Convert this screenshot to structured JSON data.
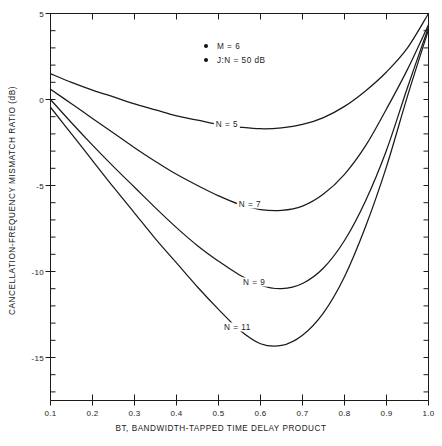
{
  "chart_data": {
    "type": "line",
    "title": "",
    "xlabel": "BT, BANDWIDTH-TAPPED TIME DELAY PRODUCT",
    "ylabel": "CANCELLATION-FREQUENCY MISMATCH RATIO (dB)",
    "xlim": [
      0.1,
      1.0
    ],
    "ylim": [
      -17.5,
      5
    ],
    "grid": false,
    "legend_position": "top-center",
    "xticks": [
      0.1,
      0.2,
      0.3,
      0.4,
      0.5,
      0.6,
      0.7,
      0.8,
      0.9,
      1.0
    ],
    "xtick_labels": [
      "0.1",
      "0.2",
      "0.3",
      "0.4",
      "0.5",
      "0.6",
      "0.7",
      "0.8",
      "0.9",
      "1.0"
    ],
    "yticks": [
      5,
      0,
      -5,
      -10,
      -15
    ],
    "ytick_labels": [
      "5",
      "0",
      "-5",
      "-10",
      "-15"
    ],
    "y_minor_ticks": [
      4,
      3,
      2,
      1,
      -1,
      -2,
      -3,
      -4,
      -6,
      -7,
      -8,
      -9,
      -11,
      -12,
      -13,
      -14,
      -16,
      -17
    ],
    "annotations": [
      {
        "text": "M = 6",
        "marker": "filled-circle"
      },
      {
        "text": "J:N = 50 dB",
        "marker": "filled-circle"
      }
    ],
    "series": [
      {
        "name": "N = 5",
        "label": "N = 5",
        "label_x": 0.52,
        "label_y": -1.45,
        "x": [
          0.1,
          0.15,
          0.2,
          0.25,
          0.3,
          0.35,
          0.4,
          0.45,
          0.5,
          0.55,
          0.6,
          0.65,
          0.7,
          0.75,
          0.8,
          0.85,
          0.9,
          0.95,
          1.0
        ],
        "y": [
          1.5,
          1.0,
          0.55,
          0.15,
          -0.25,
          -0.6,
          -0.95,
          -1.2,
          -1.45,
          -1.6,
          -1.7,
          -1.65,
          -1.45,
          -1.05,
          -0.4,
          0.5,
          1.6,
          3.0,
          5.0
        ]
      },
      {
        "name": "N = 7",
        "label": "N = 7",
        "label_x": 0.575,
        "label_y": -6.1,
        "x": [
          0.1,
          0.15,
          0.2,
          0.25,
          0.3,
          0.35,
          0.4,
          0.45,
          0.5,
          0.55,
          0.6,
          0.65,
          0.7,
          0.75,
          0.8,
          0.85,
          0.9,
          0.95,
          1.0
        ],
        "y": [
          0.6,
          -0.25,
          -1.1,
          -1.95,
          -2.8,
          -3.6,
          -4.35,
          -5.0,
          -5.6,
          -6.1,
          -6.4,
          -6.45,
          -6.2,
          -5.5,
          -4.35,
          -2.7,
          -0.55,
          1.75,
          4.35
        ]
      },
      {
        "name": "N = 9",
        "label": "N = 9",
        "label_x": 0.585,
        "label_y": -10.6,
        "x": [
          0.1,
          0.15,
          0.2,
          0.25,
          0.3,
          0.35,
          0.4,
          0.45,
          0.5,
          0.55,
          0.6,
          0.65,
          0.7,
          0.75,
          0.8,
          0.85,
          0.9,
          0.95,
          1.0
        ],
        "y": [
          0.0,
          -1.35,
          -2.65,
          -3.9,
          -5.1,
          -6.3,
          -7.45,
          -8.5,
          -9.4,
          -10.2,
          -10.8,
          -11.0,
          -10.7,
          -9.8,
          -8.2,
          -5.9,
          -2.95,
          0.7,
          4.2
        ]
      },
      {
        "name": "N = 11",
        "label": "N = 11",
        "label_x": 0.545,
        "label_y": -13.2,
        "x": [
          0.1,
          0.15,
          0.2,
          0.25,
          0.3,
          0.35,
          0.4,
          0.45,
          0.5,
          0.55,
          0.6,
          0.65,
          0.7,
          0.75,
          0.8,
          0.85,
          0.9,
          0.95,
          1.0
        ],
        "y": [
          -0.45,
          -2.0,
          -3.55,
          -5.1,
          -6.6,
          -8.1,
          -9.5,
          -10.9,
          -12.2,
          -13.4,
          -14.2,
          -14.3,
          -13.7,
          -12.4,
          -10.3,
          -7.4,
          -3.9,
          0.2,
          4.05
        ]
      }
    ]
  },
  "axes": {
    "line_color": "#1a1a1a"
  }
}
